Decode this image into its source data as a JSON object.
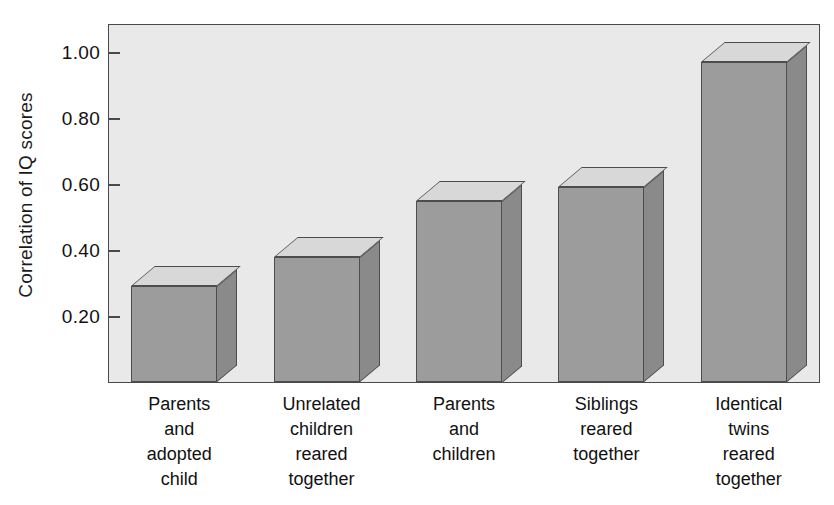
{
  "chart_data": {
    "type": "bar",
    "title": "",
    "xlabel": "",
    "ylabel": "Correlation of IQ scores",
    "categories": [
      "Parents and adopted child",
      "Unrelated children reared together",
      "Parents and children",
      "Siblings reared together",
      "Identical twins reared together"
    ],
    "category_lines": [
      [
        "Parents",
        "and",
        "adopted",
        "child"
      ],
      [
        "Unrelated",
        "children",
        "reared",
        "together"
      ],
      [
        "Parents",
        "and",
        "children"
      ],
      [
        "Siblings",
        "reared",
        "together"
      ],
      [
        "Identical",
        "twins",
        "reared",
        "together"
      ]
    ],
    "values": [
      0.29,
      0.38,
      0.55,
      0.59,
      0.97
    ],
    "ylim": [
      0,
      1.1
    ],
    "yticks": [
      0.2,
      0.4,
      0.6,
      0.8,
      1.0
    ],
    "ytick_labels": [
      "0.20",
      "0.40",
      "0.60",
      "0.80",
      "1.00"
    ],
    "grid": false,
    "legend": null,
    "style": "3d-bars",
    "colors": {
      "bar_front": "#9c9c9c",
      "bar_side": "#8a8a8a",
      "bar_top": "#d8d8d8",
      "bar_outline": "#4d4d4d",
      "plot_background": "#e9e9e9",
      "axis": "#4a4a4a",
      "text": "#111111"
    }
  }
}
